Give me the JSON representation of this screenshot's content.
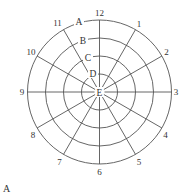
{
  "diagram": {
    "figure_label": "A",
    "center": {
      "x": 99.5,
      "y": 92
    },
    "center_label": "E",
    "rings": [
      {
        "label": "D",
        "radius": 18
      },
      {
        "label": "C",
        "radius": 36
      },
      {
        "label": "B",
        "radius": 54
      },
      {
        "label": "A",
        "radius": 72
      }
    ],
    "spokes": [
      {
        "label": "12",
        "angle_deg": 0
      },
      {
        "label": "1",
        "angle_deg": 30
      },
      {
        "label": "2",
        "angle_deg": 60
      },
      {
        "label": "3",
        "angle_deg": 90
      },
      {
        "label": "4",
        "angle_deg": 120
      },
      {
        "label": "5",
        "angle_deg": 150
      },
      {
        "label": "6",
        "angle_deg": 180
      },
      {
        "label": "7",
        "angle_deg": 210
      },
      {
        "label": "8",
        "angle_deg": 240
      },
      {
        "label": "9",
        "angle_deg": 270
      },
      {
        "label": "10",
        "angle_deg": 300
      },
      {
        "label": "11",
        "angle_deg": 330
      }
    ],
    "colors": {
      "line": "#555555",
      "text": "#333333",
      "background": "#ffffff"
    }
  }
}
